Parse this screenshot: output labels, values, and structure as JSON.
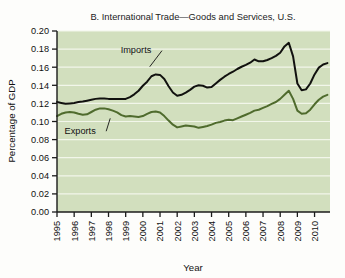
{
  "figure": {
    "background_color": "#fdfdfb",
    "plot_background_color": "#d2dfbe",
    "gridline_color": "#f2f6ea",
    "axis_color": "#1b1b1b"
  },
  "chart_data": {
    "type": "line",
    "title": "B. International Trade—Goods and Services, U.S.",
    "xlabel": "Year",
    "ylabel": "Percentage of GDP",
    "grid": true,
    "legend_position": "inline-annotations",
    "xlim": [
      1995.0,
      2010.9
    ],
    "ylim": [
      0.0,
      0.2
    ],
    "ytick_labels": [
      "0.00",
      "0.02",
      "0.04",
      "0.06",
      "0.08",
      "0.10",
      "0.12",
      "0.14",
      "0.16",
      "0.18",
      "0.20"
    ],
    "ytick_values": [
      0.0,
      0.02,
      0.04,
      0.06,
      0.08,
      0.1,
      0.12,
      0.14,
      0.16,
      0.18,
      0.2
    ],
    "xtick_labels": [
      "1995",
      "1996",
      "1997",
      "1998",
      "1999",
      "2000",
      "2001",
      "2002",
      "2003",
      "2004",
      "2005",
      "2006",
      "2007",
      "2008",
      "2009",
      "2010"
    ],
    "xtick_values": [
      1995,
      1996,
      1997,
      1998,
      1999,
      2000,
      2001,
      2002,
      2003,
      2004,
      2005,
      2006,
      2007,
      2008,
      2009,
      2010
    ],
    "series": [
      {
        "name": "Imports",
        "color": "#11110f",
        "label_text": "Imports",
        "x": [
          1995.0,
          1995.25,
          1995.5,
          1995.75,
          1996.0,
          1996.25,
          1996.5,
          1996.75,
          1997.0,
          1997.25,
          1997.5,
          1997.75,
          1998.0,
          1998.25,
          1998.5,
          1998.75,
          1999.0,
          1999.25,
          1999.5,
          1999.75,
          2000.0,
          2000.25,
          2000.5,
          2000.75,
          2001.0,
          2001.25,
          2001.5,
          2001.75,
          2002.0,
          2002.25,
          2002.5,
          2002.75,
          2003.0,
          2003.25,
          2003.5,
          2003.75,
          2004.0,
          2004.25,
          2004.5,
          2004.75,
          2005.0,
          2005.25,
          2005.5,
          2005.75,
          2006.0,
          2006.25,
          2006.5,
          2006.75,
          2007.0,
          2007.25,
          2007.5,
          2007.75,
          2008.0,
          2008.25,
          2008.5,
          2008.75,
          2009.0,
          2009.25,
          2009.5,
          2009.75,
          2010.0,
          2010.25,
          2010.5,
          2010.75
        ],
        "y": [
          0.1215,
          0.1205,
          0.1195,
          0.12,
          0.1205,
          0.1215,
          0.122,
          0.123,
          0.124,
          0.125,
          0.1255,
          0.1255,
          0.125,
          0.1248,
          0.125,
          0.1248,
          0.125,
          0.127,
          0.13,
          0.134,
          0.1395,
          0.144,
          0.15,
          0.152,
          0.1515,
          0.147,
          0.139,
          0.132,
          0.1285,
          0.1295,
          0.132,
          0.135,
          0.1385,
          0.14,
          0.1395,
          0.1375,
          0.138,
          0.142,
          0.146,
          0.1495,
          0.1525,
          0.155,
          0.158,
          0.1605,
          0.1625,
          0.165,
          0.1685,
          0.1665,
          0.1665,
          0.168,
          0.17,
          0.1725,
          0.176,
          0.183,
          0.187,
          0.172,
          0.142,
          0.1345,
          0.1355,
          0.142,
          0.152,
          0.1595,
          0.163,
          0.1645
        ]
      },
      {
        "name": "Exports",
        "color": "#4f6b2d",
        "label_text": "Exports",
        "x": [
          1995.0,
          1995.25,
          1995.5,
          1995.75,
          1996.0,
          1996.25,
          1996.5,
          1996.75,
          1997.0,
          1997.25,
          1997.5,
          1997.75,
          1998.0,
          1998.25,
          1998.5,
          1998.75,
          1999.0,
          1999.25,
          1999.5,
          1999.75,
          2000.0,
          2000.25,
          2000.5,
          2000.75,
          2001.0,
          2001.25,
          2001.5,
          2001.75,
          2002.0,
          2002.25,
          2002.5,
          2002.75,
          2003.0,
          2003.25,
          2003.5,
          2003.75,
          2004.0,
          2004.25,
          2004.5,
          2004.75,
          2005.0,
          2005.25,
          2005.5,
          2005.75,
          2006.0,
          2006.25,
          2006.5,
          2006.75,
          2007.0,
          2007.25,
          2007.5,
          2007.75,
          2008.0,
          2008.25,
          2008.5,
          2008.75,
          2009.0,
          2009.25,
          2009.5,
          2009.75,
          2010.0,
          2010.25,
          2010.5,
          2010.75
        ],
        "y": [
          0.106,
          0.1085,
          0.11,
          0.1105,
          0.11,
          0.1085,
          0.1075,
          0.108,
          0.1105,
          0.113,
          0.1145,
          0.1145,
          0.1135,
          0.112,
          0.11,
          0.107,
          0.1055,
          0.106,
          0.1055,
          0.105,
          0.106,
          0.1085,
          0.1105,
          0.111,
          0.11,
          0.106,
          0.101,
          0.0965,
          0.0935,
          0.0945,
          0.0955,
          0.095,
          0.0945,
          0.093,
          0.094,
          0.095,
          0.0965,
          0.0985,
          0.0995,
          0.101,
          0.102,
          0.1015,
          0.1035,
          0.1055,
          0.1075,
          0.1095,
          0.112,
          0.113,
          0.115,
          0.117,
          0.1195,
          0.1215,
          0.125,
          0.1295,
          0.134,
          0.125,
          0.112,
          0.1085,
          0.109,
          0.113,
          0.119,
          0.124,
          0.1275,
          0.1295
        ]
      }
    ],
    "annotations": [
      {
        "text": "Imports",
        "x": 1999.6,
        "y": 0.1755,
        "leader_to_x": 2000.4,
        "leader_to_y": 0.1605
      },
      {
        "text": "Exports",
        "x": 1996.35,
        "y": 0.0865,
        "leader_to_x": 1998.1,
        "leader_to_y": 0.1035
      }
    ]
  }
}
